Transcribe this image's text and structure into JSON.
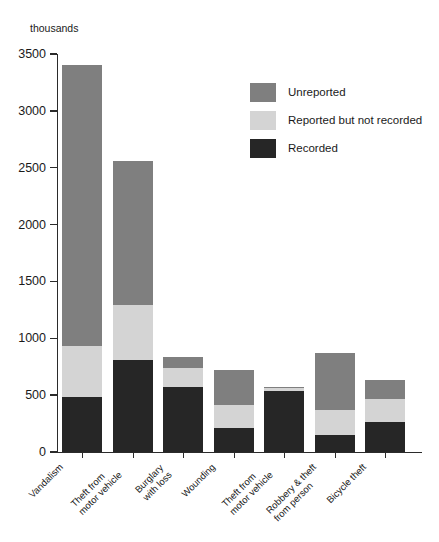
{
  "chart_data": {
    "type": "bar",
    "subtype": "stacked-bar",
    "title": "",
    "subtitle": "",
    "unit_label": "thousands",
    "xlabel": "",
    "ylabel": "",
    "ylim": [
      0,
      3500
    ],
    "ytick_values": [
      0,
      500,
      1000,
      1500,
      2000,
      2500,
      3000,
      3500
    ],
    "ytick_labels": [
      "0",
      "500",
      "1000",
      "1500",
      "2000",
      "2500",
      "3000",
      "3500"
    ],
    "grid": false,
    "legend_position": "upper-right",
    "categories": [
      "Vandalism",
      "Theft from\nmotor vehicle",
      "Burglary\nwith loss",
      "Wounding",
      "Theft from\nmotor vehicle",
      "Robbery & theft\nfrom person",
      "Bicycle theft"
    ],
    "series": [
      {
        "name": "Recorded",
        "color": "#262626",
        "values": [
          480,
          810,
          570,
          210,
          540,
          150,
          260
        ]
      },
      {
        "name": "Reported but not recorded",
        "color": "#d4d4d4",
        "values": [
          450,
          480,
          170,
          200,
          25,
          220,
          210
        ]
      },
      {
        "name": "Unreported",
        "color": "#7f7f7f",
        "values": [
          2470,
          1270,
          100,
          310,
          10,
          500,
          160
        ]
      }
    ],
    "totals": [
      3400,
      2560,
      840,
      720,
      575,
      870,
      630
    ]
  },
  "legend": {
    "items": [
      {
        "label": "Unreported",
        "swatch": "legend-swatch-unreported"
      },
      {
        "label": "Reported but not recorded",
        "swatch": "legend-swatch-reported"
      },
      {
        "label": "Recorded",
        "swatch": "legend-swatch-recorded"
      }
    ]
  },
  "colors": {
    "unreported": "#7f7f7f",
    "reported": "#d4d4d4",
    "recorded": "#262626",
    "axis": "#2b2b2b",
    "text": "#1a1a1a",
    "background": "#ffffff"
  }
}
